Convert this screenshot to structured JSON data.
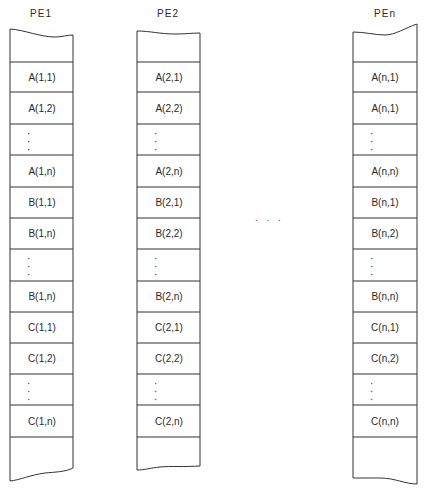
{
  "columns": [
    {
      "label": "PE1",
      "cells": [
        "",
        "A(1,1)",
        "A(1,2)",
        "⋮",
        "A(1,n)",
        "B(1,1)",
        "B(1,n)",
        "⋮",
        "B(1,n)",
        "C(1,1)",
        "C(1,2)",
        "⋮",
        "C(1,n)",
        ""
      ]
    },
    {
      "label": "PE2",
      "cells": [
        "",
        "A(2,1)",
        "A(2,2)",
        "⋮",
        "A(2,n)",
        "B(2,1)",
        "B(2,2)",
        "⋮",
        "B(2,n)",
        "C(2,1)",
        "C(2,2)",
        "⋮",
        "C(2,n)",
        ""
      ]
    },
    {
      "label": "PEn",
      "cells": [
        "",
        "A(n,1)",
        "A(n,1)",
        "⋮",
        "A(n,n)",
        "B(n,1)",
        "B(n,2)",
        "⋮",
        "B(n,n)",
        "C(n,1)",
        "C(n,2)",
        "⋮",
        "C(n,n)",
        ""
      ]
    }
  ],
  "between_columns_ellipsis": ". . .",
  "colors": {
    "line": "#333333",
    "text": "#2a2a2a",
    "background": "#ffffff"
  }
}
